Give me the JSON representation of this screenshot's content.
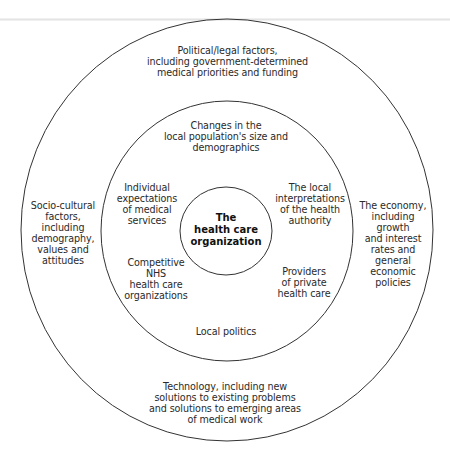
{
  "diagram": {
    "type": "concentric-circles",
    "center": {
      "label": "The\nhealth care\norganization"
    },
    "inner_ring": {
      "items": [
        {
          "id": "population",
          "position": "top",
          "label": "Changes in the\nlocal population's size and\ndemographics"
        },
        {
          "id": "individual-expectations",
          "position": "upper-left",
          "label": "Individual\nexpectations\nof medical\nservices"
        },
        {
          "id": "health-authority",
          "position": "upper-right",
          "label": "The local\ninterpretations\nof the health\nauthority"
        },
        {
          "id": "competitive-nhs",
          "position": "lower-left",
          "label": "Competitive\nNHS\nhealth care\norganizations"
        },
        {
          "id": "private-providers",
          "position": "lower-right",
          "label": "Providers\nof private\nhealth care"
        },
        {
          "id": "local-politics",
          "position": "bottom",
          "label": "Local politics"
        }
      ]
    },
    "outer_ring": {
      "items": [
        {
          "id": "political",
          "position": "top",
          "label": "Political/legal factors,\nincluding government-determined\nmedical priorities and funding"
        },
        {
          "id": "socio-cultural",
          "position": "left",
          "label": "Socio-cultural\nfactors,\nincluding\ndemography,\nvalues and\nattitudes"
        },
        {
          "id": "economy",
          "position": "right",
          "label": "The economy,\nincluding\ngrowth\nand interest\nrates and\ngeneral\neconomic\npolicies"
        },
        {
          "id": "technology",
          "position": "bottom",
          "label": "Technology, including new\nsolutions to existing problems\nand solutions to emerging areas\nof medical work"
        }
      ]
    },
    "colors": {
      "stroke": "#333333",
      "background": "#ffffff"
    }
  }
}
